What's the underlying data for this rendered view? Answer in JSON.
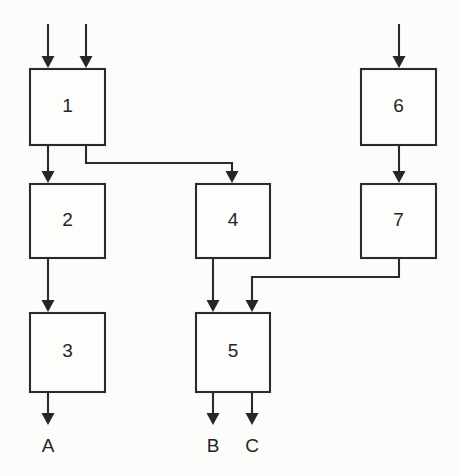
{
  "diagram": {
    "type": "block-flow-diagram",
    "background_color": "#fcfcfb",
    "line_color": "#2b2b2b",
    "box_fill": "#fdfdfc",
    "boxes": [
      {
        "id": "box-1",
        "label": "1",
        "x": 30,
        "y": 69,
        "w": 75,
        "h": 76,
        "cx": 67.5,
        "cy": 107
      },
      {
        "id": "box-2",
        "label": "2",
        "x": 30,
        "y": 184,
        "w": 75,
        "h": 74,
        "cx": 67.5,
        "cy": 221
      },
      {
        "id": "box-3",
        "label": "3",
        "x": 30,
        "y": 313,
        "w": 75,
        "h": 79,
        "cx": 67.5,
        "cy": 352
      },
      {
        "id": "box-4",
        "label": "4",
        "x": 196,
        "y": 184,
        "w": 74,
        "h": 74,
        "cx": 233,
        "cy": 221
      },
      {
        "id": "box-5",
        "label": "5",
        "x": 196,
        "y": 313,
        "w": 74,
        "h": 79,
        "cx": 233,
        "cy": 352
      },
      {
        "id": "box-6",
        "label": "6",
        "x": 361,
        "y": 69,
        "w": 75,
        "h": 76,
        "cx": 398.5,
        "cy": 107
      },
      {
        "id": "box-7",
        "label": "7",
        "x": 361,
        "y": 184,
        "w": 75,
        "h": 74,
        "cx": 398.5,
        "cy": 221
      }
    ],
    "io_labels": [
      {
        "id": "output-a",
        "label": "A",
        "x": 48,
        "y": 447
      },
      {
        "id": "output-b",
        "label": "B",
        "x": 213,
        "y": 447
      },
      {
        "id": "output-c",
        "label": "C",
        "x": 252,
        "y": 447
      }
    ],
    "connections": [
      {
        "id": "input-1-left",
        "from": "external",
        "to": "box-1",
        "path": "M48,24 L48,66",
        "arrow_at": [
          48,
          68
        ]
      },
      {
        "id": "input-1-right",
        "from": "external",
        "to": "box-1",
        "path": "M86,24 L86,66",
        "arrow_at": [
          86,
          68
        ]
      },
      {
        "id": "input-6",
        "from": "external",
        "to": "box-6",
        "path": "M399,24 L399,66",
        "arrow_at": [
          399,
          68
        ]
      },
      {
        "id": "box1-to-box2",
        "from": "box-1",
        "to": "box-2",
        "path": "M48,145 L48,181",
        "arrow_at": [
          48,
          183
        ]
      },
      {
        "id": "box1-to-box4",
        "from": "box-1",
        "to": "box-4",
        "path": "M86,145 L86,163 L232,163 L232,181",
        "arrow_at": [
          232,
          183
        ]
      },
      {
        "id": "box2-to-box3",
        "from": "box-2",
        "to": "box-3",
        "path": "M48,258 L48,310",
        "arrow_at": [
          48,
          312
        ]
      },
      {
        "id": "box3-to-a",
        "from": "box-3",
        "to": "output-a",
        "path": "M48,392 L48,423",
        "arrow_at": [
          48,
          425
        ]
      },
      {
        "id": "box6-to-box7",
        "from": "box-6",
        "to": "box-7",
        "path": "M399,145 L399,181",
        "arrow_at": [
          399,
          183
        ]
      },
      {
        "id": "box4-to-box5",
        "from": "box-4",
        "to": "box-5",
        "path": "M213,258 L213,310",
        "arrow_at": [
          213,
          312
        ]
      },
      {
        "id": "box7-to-box5",
        "from": "box-7",
        "to": "box-5",
        "path": "M399,258 L399,277 L252,277 L252,310",
        "arrow_at": [
          252,
          312
        ]
      },
      {
        "id": "box5-to-b",
        "from": "box-5",
        "to": "output-b",
        "path": "M213,392 L213,423",
        "arrow_at": [
          213,
          425
        ]
      },
      {
        "id": "box5-to-c",
        "from": "box-5",
        "to": "output-c",
        "path": "M252,392 L252,423",
        "arrow_at": [
          252,
          425
        ]
      }
    ]
  }
}
